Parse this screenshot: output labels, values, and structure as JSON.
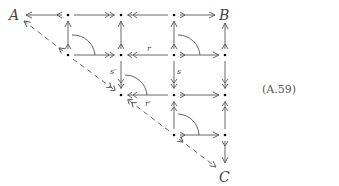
{
  "diagram": {
    "equation_number": "(A.59)",
    "objects": {
      "A": "A",
      "B": "B",
      "C": "C"
    },
    "labels": {
      "r": "r",
      "s": "s",
      "r_prime": "r′",
      "s_prime": "s′"
    },
    "colors": {
      "stroke": "#555555",
      "node": "#000000",
      "text": "#333333"
    },
    "nodes": [
      {
        "id": "A",
        "x": 17,
        "y": 15
      },
      {
        "id": "n01",
        "x": 68,
        "y": 15
      },
      {
        "id": "n02",
        "x": 121,
        "y": 15
      },
      {
        "id": "n03",
        "x": 174,
        "y": 15
      },
      {
        "id": "B",
        "x": 225,
        "y": 15
      },
      {
        "id": "n11",
        "x": 68,
        "y": 55
      },
      {
        "id": "n12",
        "x": 121,
        "y": 55
      },
      {
        "id": "n13",
        "x": 174,
        "y": 55
      },
      {
        "id": "n14",
        "x": 225,
        "y": 55
      },
      {
        "id": "n22",
        "x": 121,
        "y": 95
      },
      {
        "id": "n23",
        "x": 174,
        "y": 95
      },
      {
        "id": "n24",
        "x": 225,
        "y": 95
      },
      {
        "id": "n33",
        "x": 174,
        "y": 135
      },
      {
        "id": "n34",
        "x": 225,
        "y": 135
      },
      {
        "id": "C",
        "x": 225,
        "y": 175
      }
    ],
    "arrows": [
      {
        "from": "n01",
        "to": "A",
        "type": "mono"
      },
      {
        "from": "n01",
        "to": "n02",
        "type": "epi"
      },
      {
        "from": "n03",
        "to": "n02",
        "type": "epi"
      },
      {
        "from": "n03",
        "to": "B",
        "type": "mono"
      },
      {
        "from": "n11",
        "to": "n01",
        "type": "mono"
      },
      {
        "from": "n12",
        "to": "n02",
        "type": "mono"
      },
      {
        "from": "n13",
        "to": "n03",
        "type": "mono"
      },
      {
        "from": "n14",
        "to": "B",
        "type": "mono"
      },
      {
        "from": "n11",
        "to": "n12",
        "type": "epi"
      },
      {
        "from": "n13",
        "to": "n12",
        "type": "epi",
        "label": "r"
      },
      {
        "from": "n13",
        "to": "n14",
        "type": "mono"
      },
      {
        "from": "n12",
        "to": "n22",
        "type": "epi",
        "label": "s′"
      },
      {
        "from": "n13",
        "to": "n23",
        "type": "epi",
        "label": "s"
      },
      {
        "from": "n14",
        "to": "n24",
        "type": "epi"
      },
      {
        "from": "n23",
        "to": "n22",
        "type": "epi",
        "label": "r′"
      },
      {
        "from": "n23",
        "to": "n24",
        "type": "mono"
      },
      {
        "from": "n33",
        "to": "n23",
        "type": "mono"
      },
      {
        "from": "n34",
        "to": "n24",
        "type": "mono"
      },
      {
        "from": "n33",
        "to": "n34",
        "type": "mono"
      },
      {
        "from": "n34",
        "to": "C",
        "type": "mono"
      },
      {
        "from": "n11",
        "to": "A",
        "type": "mono-dashed"
      },
      {
        "from": "n11",
        "to": "n22",
        "type": "epi-dashed"
      },
      {
        "from": "n22",
        "to": "n11",
        "type": "mono-dashed"
      },
      {
        "from": "n33",
        "to": "C",
        "type": "mono-dashed"
      }
    ]
  }
}
